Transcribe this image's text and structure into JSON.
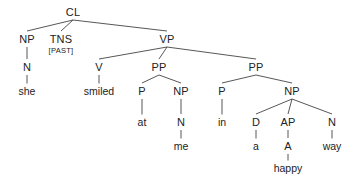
{
  "diagram": {
    "kind": "syntax-tree",
    "sentence": "she smiled at me in a happy way",
    "edge_color": "#444444",
    "text_color": "#222222",
    "background": "#ffffff",
    "nodes": [
      {
        "id": "cl",
        "label": "CL",
        "type": "category",
        "x": 73,
        "y": 12
      },
      {
        "id": "np1",
        "label": "NP",
        "type": "category",
        "x": 27,
        "y": 39
      },
      {
        "id": "tns",
        "label": "TNS",
        "type": "category",
        "x": 61,
        "y": 39
      },
      {
        "id": "past",
        "label": "[PAST]",
        "type": "feature",
        "x": 61,
        "y": 51
      },
      {
        "id": "vp",
        "label": "VP",
        "type": "category",
        "x": 167,
        "y": 39
      },
      {
        "id": "n1",
        "label": "N",
        "type": "category",
        "x": 27,
        "y": 67
      },
      {
        "id": "v",
        "label": "V",
        "type": "category",
        "x": 99,
        "y": 67
      },
      {
        "id": "pp1",
        "label": "PP",
        "type": "category",
        "x": 159,
        "y": 67
      },
      {
        "id": "pp2",
        "label": "PP",
        "type": "category",
        "x": 256,
        "y": 67
      },
      {
        "id": "she",
        "label": "she",
        "type": "word",
        "x": 27,
        "y": 91
      },
      {
        "id": "smiled",
        "label": "smiled",
        "type": "word",
        "x": 99,
        "y": 91
      },
      {
        "id": "p1",
        "label": "P",
        "type": "category",
        "x": 142,
        "y": 91
      },
      {
        "id": "np2",
        "label": "NP",
        "type": "category",
        "x": 181,
        "y": 91
      },
      {
        "id": "p2",
        "label": "P",
        "type": "category",
        "x": 222,
        "y": 91
      },
      {
        "id": "np3",
        "label": "NP",
        "type": "category",
        "x": 292,
        "y": 91
      },
      {
        "id": "at",
        "label": "at",
        "type": "word",
        "x": 142,
        "y": 122
      },
      {
        "id": "n2",
        "label": "N",
        "type": "category",
        "x": 181,
        "y": 122
      },
      {
        "id": "in",
        "label": "in",
        "type": "word",
        "x": 222,
        "y": 122
      },
      {
        "id": "d",
        "label": "D",
        "type": "category",
        "x": 256,
        "y": 122
      },
      {
        "id": "ap",
        "label": "AP",
        "type": "category",
        "x": 288,
        "y": 122
      },
      {
        "id": "n3",
        "label": "N",
        "type": "category",
        "x": 332,
        "y": 122
      },
      {
        "id": "me",
        "label": "me",
        "type": "word",
        "x": 181,
        "y": 146
      },
      {
        "id": "a",
        "label": "a",
        "type": "word",
        "x": 256,
        "y": 146
      },
      {
        "id": "adj",
        "label": "A",
        "type": "category",
        "x": 288,
        "y": 146
      },
      {
        "id": "way",
        "label": "way",
        "type": "word",
        "x": 332,
        "y": 146
      },
      {
        "id": "happy",
        "label": "happy",
        "type": "word",
        "x": 288,
        "y": 168
      }
    ],
    "edges": [
      {
        "from": "cl",
        "to": "np1"
      },
      {
        "from": "cl",
        "to": "tns"
      },
      {
        "from": "cl",
        "to": "vp"
      },
      {
        "from": "np1",
        "to": "n1"
      },
      {
        "from": "n1",
        "to": "she"
      },
      {
        "from": "vp",
        "to": "v"
      },
      {
        "from": "vp",
        "to": "pp1"
      },
      {
        "from": "vp",
        "to": "pp2"
      },
      {
        "from": "v",
        "to": "smiled"
      },
      {
        "from": "pp1",
        "to": "p1"
      },
      {
        "from": "pp1",
        "to": "np2"
      },
      {
        "from": "p1",
        "to": "at"
      },
      {
        "from": "np2",
        "to": "n2"
      },
      {
        "from": "n2",
        "to": "me"
      },
      {
        "from": "pp2",
        "to": "p2"
      },
      {
        "from": "pp2",
        "to": "np3"
      },
      {
        "from": "p2",
        "to": "in"
      },
      {
        "from": "np3",
        "to": "d"
      },
      {
        "from": "np3",
        "to": "ap"
      },
      {
        "from": "np3",
        "to": "n3"
      },
      {
        "from": "d",
        "to": "a"
      },
      {
        "from": "ap",
        "to": "adj"
      },
      {
        "from": "n3",
        "to": "way"
      },
      {
        "from": "adj",
        "to": "happy"
      }
    ]
  }
}
